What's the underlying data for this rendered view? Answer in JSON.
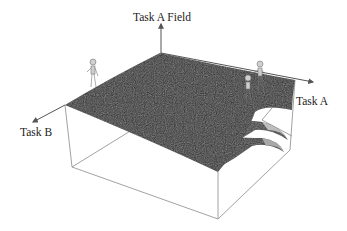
{
  "diagram": {
    "type": "3d-surface",
    "axes": {
      "vertical": "Task A Field",
      "right": "Task A",
      "left": "Task B"
    },
    "figures": [
      {
        "name": "person-left",
        "position": "left ridge"
      },
      {
        "name": "person-right-back",
        "position": "right ridge"
      },
      {
        "name": "person-right-front",
        "position": "right ridge"
      }
    ],
    "colors": {
      "surface": "#2b2b2b",
      "box_lines": "#888888",
      "axis": "#555555",
      "text": "#222222"
    }
  }
}
